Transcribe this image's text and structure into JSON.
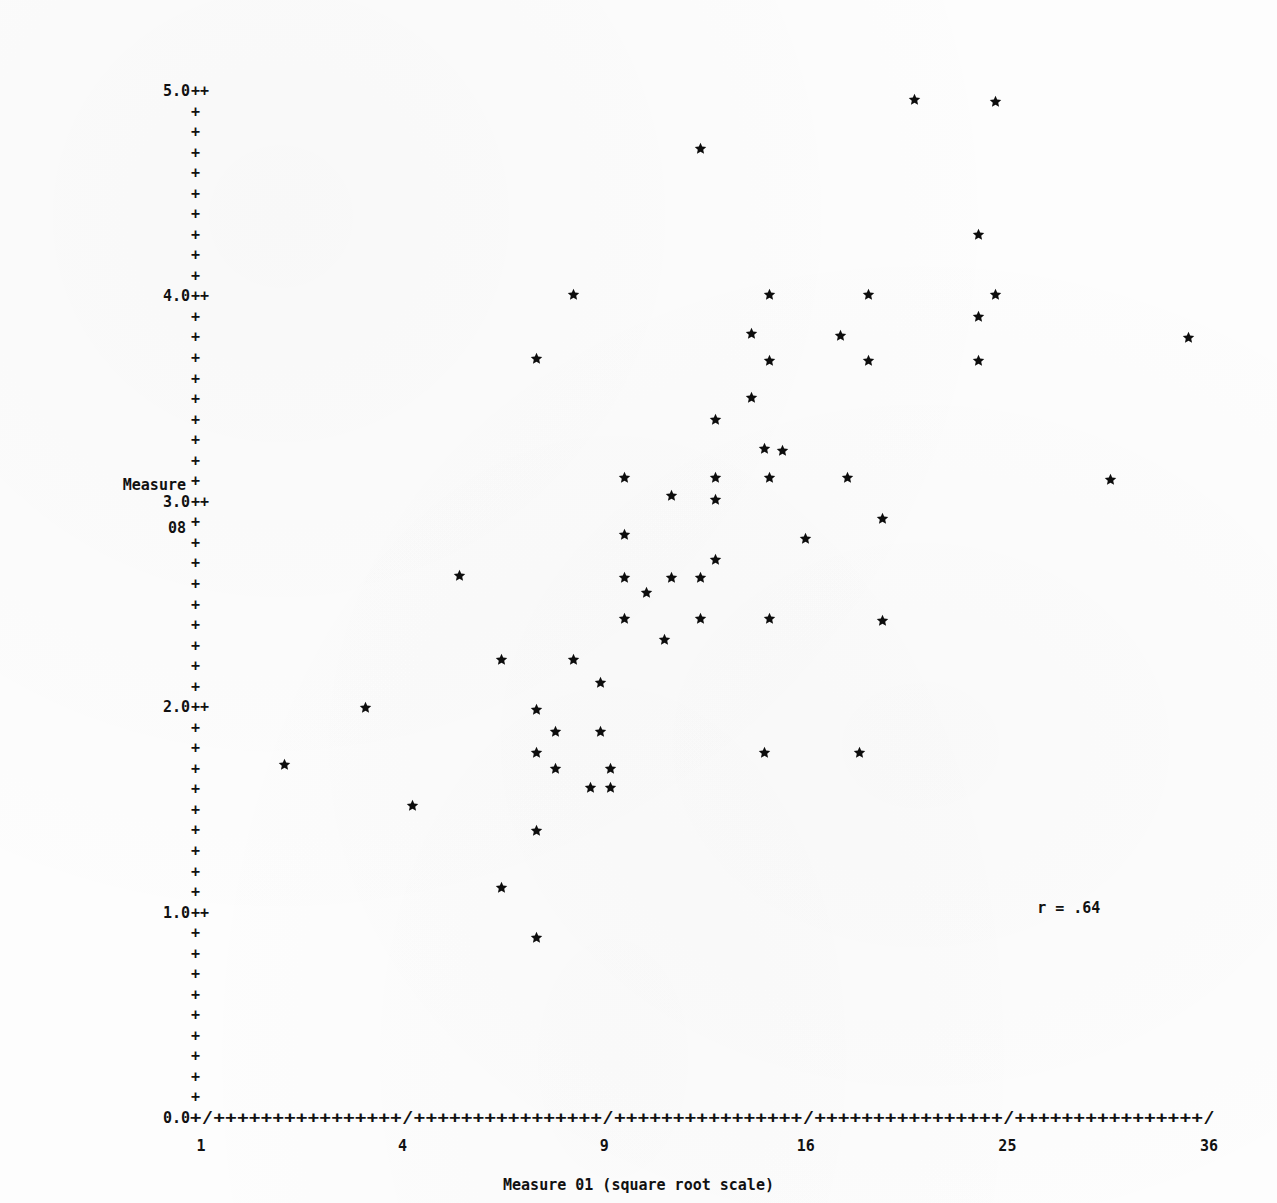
{
  "figure": {
    "marker_glyph": "star",
    "ink_color": "#111111",
    "background_color": "#fdfdfd"
  },
  "annotations": {
    "correlation_label": "r = .64"
  },
  "y_axis": {
    "title_line1": "Measure",
    "title_line2": "08",
    "tick_labels": [
      "5.0",
      "4.0",
      "3.0",
      "2.0",
      "1.0",
      "0.0"
    ],
    "tick_suffix": "++",
    "minor_glyph": "+",
    "minors_between_major": 9
  },
  "x_axis": {
    "caption": "Measure 01 (square root scale)",
    "tick_labels": [
      "1",
      "4",
      "9",
      "16",
      "25",
      "36"
    ],
    "axis_line": "+/++++++++++++++++/++++++++++++++++/++++++++++++++++/++++++++++++++++/++++++++++++++++/",
    "origin_label": "0.0",
    "tick_glyph": "/",
    "fill_glyph": "+"
  },
  "chart_data": {
    "type": "scatter",
    "title": "",
    "subtitle": "",
    "xlabel": "Measure 01 (square root scale)",
    "ylabel": "Measure 08",
    "xscale": "sqrt",
    "yscale": "linear",
    "grid": false,
    "legend": false,
    "xticks": [
      1,
      4,
      9,
      16,
      25,
      36
    ],
    "yticks": [
      0.0,
      1.0,
      2.0,
      3.0,
      4.0,
      5.0
    ],
    "xlim": [
      1,
      36
    ],
    "ylim": [
      0.0,
      5.0
    ],
    "annotations": [
      {
        "text": "r = .64",
        "x": 26.5,
        "y": 1.02
      }
    ],
    "n_points": 68,
    "points": [
      {
        "x": 20.6,
        "y": 4.96
      },
      {
        "x": 24.4,
        "y": 4.95
      },
      {
        "x": 12.1,
        "y": 4.72
      },
      {
        "x": 23.6,
        "y": 4.3
      },
      {
        "x": 8.1,
        "y": 4.01
      },
      {
        "x": 14.6,
        "y": 4.01
      },
      {
        "x": 18.6,
        "y": 4.01
      },
      {
        "x": 24.4,
        "y": 4.01
      },
      {
        "x": 23.6,
        "y": 3.9
      },
      {
        "x": 13.9,
        "y": 3.82
      },
      {
        "x": 17.4,
        "y": 3.81
      },
      {
        "x": 34.8,
        "y": 3.8
      },
      {
        "x": 7.1,
        "y": 3.7
      },
      {
        "x": 14.6,
        "y": 3.69
      },
      {
        "x": 18.6,
        "y": 3.69
      },
      {
        "x": 23.6,
        "y": 3.69
      },
      {
        "x": 13.9,
        "y": 3.51
      },
      {
        "x": 12.6,
        "y": 3.4
      },
      {
        "x": 14.4,
        "y": 3.26
      },
      {
        "x": 15.1,
        "y": 3.25
      },
      {
        "x": 9.6,
        "y": 3.12
      },
      {
        "x": 12.6,
        "y": 3.12
      },
      {
        "x": 14.6,
        "y": 3.12
      },
      {
        "x": 17.7,
        "y": 3.12
      },
      {
        "x": 30.4,
        "y": 3.11
      },
      {
        "x": 11.1,
        "y": 3.03
      },
      {
        "x": 12.6,
        "y": 3.01
      },
      {
        "x": 19.2,
        "y": 2.92
      },
      {
        "x": 9.6,
        "y": 2.84
      },
      {
        "x": 16.0,
        "y": 2.82
      },
      {
        "x": 12.6,
        "y": 2.72
      },
      {
        "x": 5.2,
        "y": 2.64
      },
      {
        "x": 9.6,
        "y": 2.63
      },
      {
        "x": 11.1,
        "y": 2.63
      },
      {
        "x": 12.1,
        "y": 2.63
      },
      {
        "x": 10.3,
        "y": 2.56
      },
      {
        "x": 9.6,
        "y": 2.43
      },
      {
        "x": 12.1,
        "y": 2.43
      },
      {
        "x": 14.6,
        "y": 2.43
      },
      {
        "x": 19.2,
        "y": 2.42
      },
      {
        "x": 10.9,
        "y": 2.33
      },
      {
        "x": 6.2,
        "y": 2.23
      },
      {
        "x": 8.1,
        "y": 2.23
      },
      {
        "x": 8.9,
        "y": 2.12
      },
      {
        "x": 3.3,
        "y": 2.0
      },
      {
        "x": 7.1,
        "y": 1.99
      },
      {
        "x": 7.6,
        "y": 1.88
      },
      {
        "x": 8.9,
        "y": 1.88
      },
      {
        "x": 7.1,
        "y": 1.78
      },
      {
        "x": 14.4,
        "y": 1.78
      },
      {
        "x": 18.2,
        "y": 1.78
      },
      {
        "x": 2.0,
        "y": 1.72
      },
      {
        "x": 7.6,
        "y": 1.7
      },
      {
        "x": 9.2,
        "y": 1.7
      },
      {
        "x": 8.6,
        "y": 1.61
      },
      {
        "x": 9.2,
        "y": 1.61
      },
      {
        "x": 4.2,
        "y": 1.52
      },
      {
        "x": 7.1,
        "y": 1.4
      },
      {
        "x": 6.2,
        "y": 1.12
      },
      {
        "x": 7.1,
        "y": 0.88
      }
    ]
  }
}
